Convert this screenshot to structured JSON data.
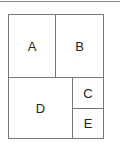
{
  "diagram": {
    "type": "layout-grid",
    "cells": [
      {
        "id": "A",
        "label": "A"
      },
      {
        "id": "B",
        "label": "B"
      },
      {
        "id": "C",
        "label": "C"
      },
      {
        "id": "D",
        "label": "D"
      },
      {
        "id": "E",
        "label": "E"
      }
    ],
    "colors": {
      "line": "#777777",
      "text": "#222222",
      "background": "#ffffff"
    }
  }
}
